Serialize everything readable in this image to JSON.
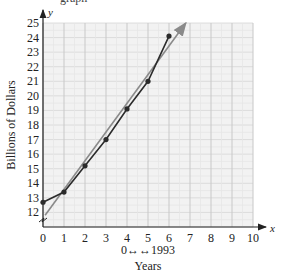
{
  "title_partial": "graph",
  "chart_data": {
    "type": "line",
    "title": "",
    "xlabel": "Years",
    "x_note": "0↔↔1993",
    "ylabel": "Billions of Dollars",
    "x_axis_var": "x",
    "y_axis_var": "y",
    "xlim": [
      0,
      10
    ],
    "ylim": [
      11,
      25
    ],
    "x_ticks": [
      0,
      1,
      2,
      3,
      4,
      5,
      6,
      7,
      8,
      9,
      10
    ],
    "y_ticks": [
      12,
      13,
      14,
      15,
      16,
      17,
      18,
      19,
      20,
      21,
      22,
      23,
      24,
      25
    ],
    "grid": true,
    "series": [
      {
        "name": "Data",
        "style": "line-with-points",
        "color": "#2b2b2b",
        "x": [
          0,
          1,
          2,
          3,
          4,
          5,
          6
        ],
        "values": [
          12.7,
          13.4,
          15.2,
          17.0,
          19.1,
          21.0,
          24.1
        ]
      },
      {
        "name": "Linear fit",
        "style": "arrow-line",
        "color": "#8a8a8a",
        "x": [
          0.1,
          6.8
        ],
        "values": [
          11.8,
          25.0
        ]
      }
    ]
  }
}
